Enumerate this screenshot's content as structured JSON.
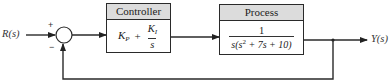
{
  "diagram": {
    "type": "feedback-control-block-diagram",
    "input": {
      "label": "R(s)"
    },
    "output": {
      "label": "Y(s)"
    },
    "summing_junction": {
      "plus_sign": "+",
      "minus_sign": "−"
    },
    "controller": {
      "title": "Controller",
      "tf": {
        "kp_main": "K",
        "kp_sub": "P",
        "plus": "+",
        "ki_main": "K",
        "ki_sub": "I",
        "den": "s"
      }
    },
    "process": {
      "title": "Process",
      "tf": {
        "num": "1",
        "den_pre": "s(s",
        "den_exp": "2",
        "den_post": " + 7s + 10)"
      }
    },
    "feedback": {
      "type": "unity negative feedback"
    },
    "colors": {
      "line": "#2a2a2a",
      "header_fill": "#dcdcdc",
      "text": "#222222"
    }
  }
}
